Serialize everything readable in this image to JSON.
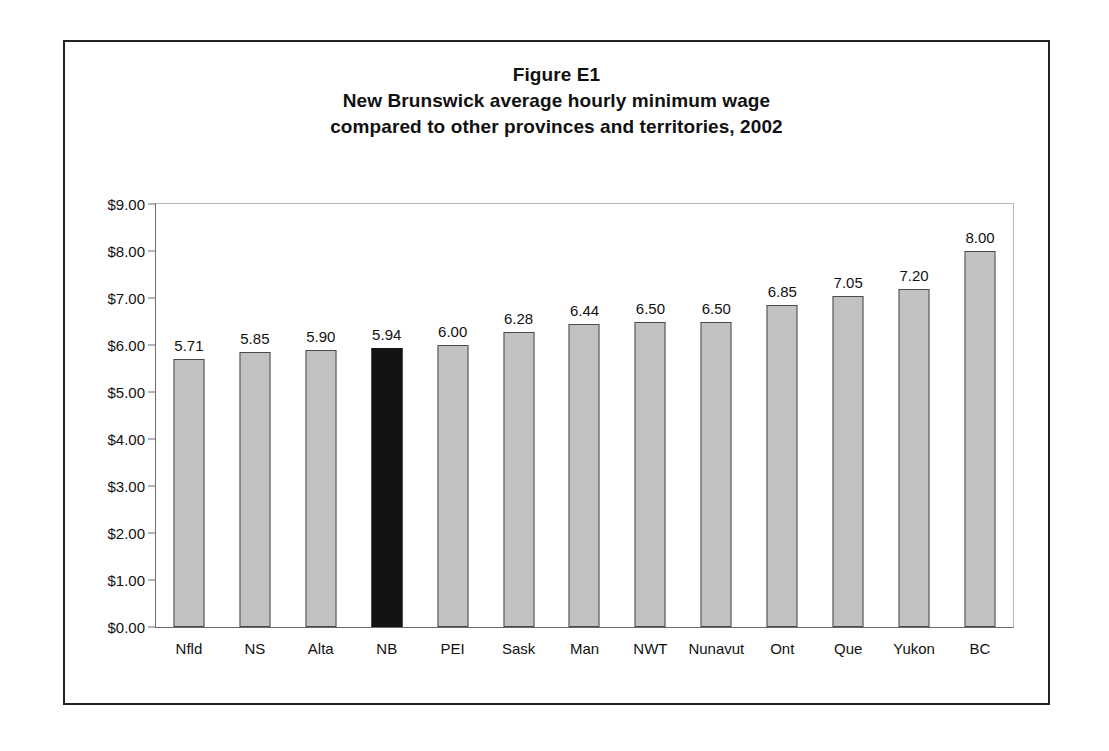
{
  "figure": {
    "title_lines": [
      "Figure E1",
      "New Brunswick average hourly minimum wage",
      "compared to other provinces and territories, 2002"
    ]
  },
  "colors": {
    "bar_fill": "#c2c2c2",
    "bar_border": "#4a4a4a",
    "highlight_fill": "#131313",
    "frame": "#222222",
    "axis": "#6b6b6b",
    "text": "#111111"
  },
  "chart_data": {
    "type": "bar",
    "xlabel": "",
    "ylabel": "",
    "ylim": [
      0,
      9
    ],
    "ytick_step": 1,
    "ytick_labels": [
      "$0.00",
      "$1.00",
      "$2.00",
      "$3.00",
      "$4.00",
      "$5.00",
      "$6.00",
      "$7.00",
      "$8.00",
      "$9.00"
    ],
    "ytick_values": [
      0,
      1,
      2,
      3,
      4,
      5,
      6,
      7,
      8,
      9
    ],
    "grid": false,
    "legend": null,
    "highlight_category": "NB",
    "categories": [
      "Nfld",
      "NS",
      "Alta",
      "NB",
      "PEI",
      "Sask",
      "Man",
      "NWT",
      "Nunavut",
      "Ont",
      "Que",
      "Yukon",
      "BC"
    ],
    "values": [
      5.71,
      5.85,
      5.9,
      5.94,
      6.0,
      6.28,
      6.44,
      6.5,
      6.5,
      6.85,
      7.05,
      7.2,
      8.0
    ],
    "value_labels": [
      "5.71",
      "5.85",
      "5.90",
      "5.94",
      "6.00",
      "6.28",
      "6.44",
      "6.50",
      "6.50",
      "6.85",
      "7.05",
      "7.20",
      "8.00"
    ]
  }
}
